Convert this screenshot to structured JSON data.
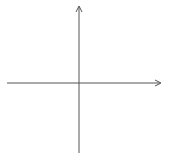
{
  "diagram": {
    "type": "coordinate-grid",
    "axes": {
      "x_label": "x",
      "y_label": "y",
      "x_ticks": [
        "−5",
        "−4",
        "−3",
        "−2",
        "−1",
        "1",
        "2",
        "3",
        "4",
        "5"
      ],
      "y_ticks_positive": [
        "5",
        "4",
        "3",
        "2",
        "1"
      ],
      "y_ticks_negative": [
        "−1",
        "−2",
        "−3",
        "−4",
        "−5"
      ],
      "x_range": [
        -6,
        6
      ],
      "y_range": [
        -6,
        6
      ]
    },
    "colors": {
      "grid": "#d8d8d8",
      "axis": "#555555",
      "text": "#333333",
      "background": "#ffffff"
    }
  }
}
